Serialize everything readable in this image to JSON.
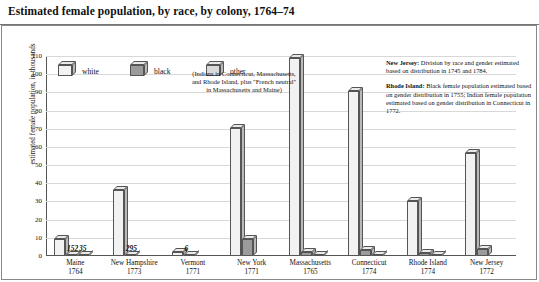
{
  "title": "Estimated female population, by race, by colony, 1764–74",
  "legend": {
    "items": [
      {
        "key": "white",
        "label": "white",
        "color": "#f2f2f2"
      },
      {
        "key": "black",
        "label": "black",
        "color": "#9b9b9b"
      },
      {
        "key": "other",
        "label": "other",
        "color": "#d9d9d9"
      }
    ],
    "other_note": "(Indians in Connecticut, Massachusetts, and Rhode Island, plus \"French neutral\" in Massachusetts and Maine)"
  },
  "notes": [
    {
      "heading": "New Jersey:",
      "text": " Division by race and gender estimated based on distribution in 1745 and 1784."
    },
    {
      "heading": "Rhode Island:",
      "text": " Black female population estimated based on gender distribution in 1755; Indian female population estimated based on gender distribution in Connecticut in 1772."
    }
  ],
  "chart_data": {
    "type": "bar",
    "title": "Estimated female population, by race, by colony, 1764–74",
    "xlabel": "",
    "ylabel": "estimated female population, in thousands",
    "ylim": [
      0,
      110
    ],
    "yticks": [
      0,
      10,
      20,
      30,
      40,
      50,
      60,
      70,
      80,
      90,
      100,
      110
    ],
    "grid": true,
    "legend_position": "inside top-left",
    "categories": [
      {
        "colony": "Maine",
        "year": "1764"
      },
      {
        "colony": "New Hampshire",
        "year": "1773"
      },
      {
        "colony": "Vermont",
        "year": "1771"
      },
      {
        "colony": "New York",
        "year": "1771"
      },
      {
        "colony": "Massachusetts",
        "year": "1765"
      },
      {
        "colony": "Connecticut",
        "year": "1774"
      },
      {
        "colony": "Rhode Island",
        "year": "1774"
      },
      {
        "colony": "New Jersey",
        "year": "1772"
      }
    ],
    "series": [
      {
        "name": "white",
        "values": [
          9.5,
          36.5,
          2.3,
          70.5,
          109.0,
          91.0,
          30.5,
          56.5
        ]
      },
      {
        "name": "black",
        "values": [
          0.152,
          0.295,
          0.006,
          9.5,
          2.3,
          3.2,
          1.9,
          4.0
        ]
      },
      {
        "name": "other",
        "values": [
          0.035,
          0.0,
          0.0,
          0.0,
          0.6,
          0.7,
          0.7,
          0.0
        ]
      }
    ],
    "point_labels": [
      {
        "category": "Maine",
        "series": "black",
        "text": "152"
      },
      {
        "category": "Maine",
        "series": "other",
        "text": "35"
      },
      {
        "category": "New Hampshire",
        "series": "black",
        "text": "295"
      },
      {
        "category": "Vermont",
        "series": "black",
        "text": "6"
      }
    ]
  }
}
